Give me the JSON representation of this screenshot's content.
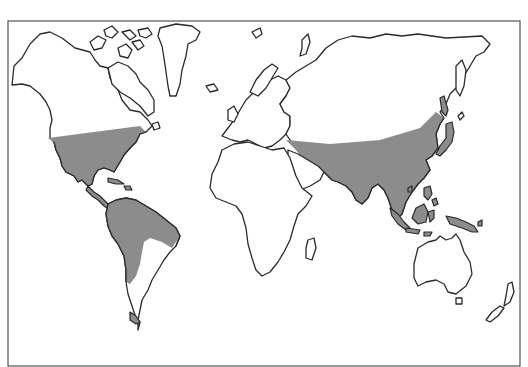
{
  "map": {
    "type": "world-outline-distribution-map",
    "projection": "simplified cylindrical",
    "colors": {
      "background": "#ffffff",
      "land_fill": "#ffffff",
      "coastline": "#2a2a2a",
      "shaded_region": "#8c8c8c",
      "frame": "#555555"
    },
    "shaded_regions": [
      "southern-north-america",
      "central-america-caribbean",
      "northern-south-america",
      "southern-tip-south-america",
      "southern-eurasia-band",
      "south-asia",
      "east-asia",
      "japan",
      "southeast-asia-maritime",
      "new-guinea"
    ],
    "unshaded_landmasses": [
      "northern-north-america",
      "greenland",
      "arctic-islands",
      "europe",
      "northern-asia",
      "africa",
      "arabia",
      "madagascar",
      "southern-south-america",
      "australia",
      "tasmania",
      "new-zealand"
    ]
  }
}
